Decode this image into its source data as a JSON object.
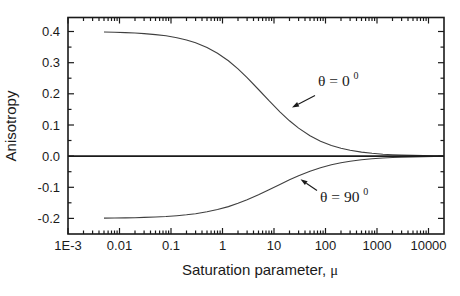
{
  "figure": {
    "background": "#ffffff",
    "ink_color": "#1a1a1a",
    "curve_color": "#3f3f3f"
  },
  "chart_data": {
    "type": "line",
    "title": "",
    "xlabel": "Saturation parameter, μ",
    "xlabel_parts": {
      "main": "Saturation parameter, ",
      "mu": "μ"
    },
    "ylabel": "Anisotropy",
    "x_scale": "log",
    "xlim": [
      0.001,
      20000
    ],
    "ylim": [
      -0.25,
      0.445
    ],
    "grid": false,
    "zero_line": true,
    "x_ticks": [
      0.001,
      0.01,
      0.1,
      1,
      10,
      100,
      1000,
      10000
    ],
    "x_tick_labels": [
      "1E-3",
      "0.01",
      "0.1",
      "1",
      "10",
      "100",
      "1000",
      "10000"
    ],
    "y_ticks": [
      -0.2,
      -0.1,
      0.0,
      0.1,
      0.2,
      0.3,
      0.4
    ],
    "y_tick_labels": [
      "-0.2",
      "-0.1",
      "0.0",
      "0.1",
      "0.2",
      "0.3",
      "0.4"
    ],
    "y_minor_step": 0.05,
    "series": [
      {
        "name": "theta-0",
        "label": "θ = 0⁰",
        "x": [
          0.005,
          0.008,
          0.013,
          0.02,
          0.03,
          0.05,
          0.08,
          0.13,
          0.2,
          0.3,
          0.5,
          0.8,
          1.3,
          2,
          3,
          5,
          8,
          13,
          20,
          30,
          50,
          80,
          130,
          200,
          300,
          500,
          800,
          1300,
          2000,
          3000,
          5000,
          8000,
          13000,
          20000
        ],
        "y": [
          0.3983,
          0.3976,
          0.3965,
          0.3951,
          0.3934,
          0.3902,
          0.3861,
          0.3801,
          0.3728,
          0.3638,
          0.3485,
          0.33,
          0.3059,
          0.2799,
          0.2521,
          0.214,
          0.1779,
          0.1422,
          0.1134,
          0.0898,
          0.0654,
          0.0479,
          0.0342,
          0.0252,
          0.0187,
          0.0128,
          0.009,
          0.0063,
          0.0045,
          0.0033,
          0.0022,
          0.0016,
          0.0011,
          0.0008
        ]
      },
      {
        "name": "theta-90",
        "label": "θ = 90⁰",
        "x": [
          0.005,
          0.008,
          0.013,
          0.02,
          0.03,
          0.05,
          0.08,
          0.13,
          0.2,
          0.3,
          0.5,
          0.8,
          1.3,
          2,
          3,
          5,
          8,
          13,
          20,
          30,
          50,
          80,
          130,
          200,
          300,
          500,
          800,
          1300,
          2000,
          3000,
          5000,
          8000,
          13000,
          20000
        ],
        "y": [
          -0.1991,
          -0.1987,
          -0.1982,
          -0.1976,
          -0.1968,
          -0.1955,
          -0.1937,
          -0.1912,
          -0.1883,
          -0.1847,
          -0.1787,
          -0.1715,
          -0.162,
          -0.1516,
          -0.1403,
          -0.1241,
          -0.1079,
          -0.0907,
          -0.0759,
          -0.0629,
          -0.0484,
          -0.0372,
          -0.0279,
          -0.0213,
          -0.0164,
          -0.0117,
          -0.0085,
          -0.0061,
          -0.0045,
          -0.0034,
          -0.0024,
          -0.0017,
          -0.0012,
          -0.0009
        ]
      }
    ],
    "annotations": [
      {
        "base": "θ = 0",
        "sup": "0"
      },
      {
        "base": "θ = 90",
        "sup": "0"
      }
    ]
  }
}
